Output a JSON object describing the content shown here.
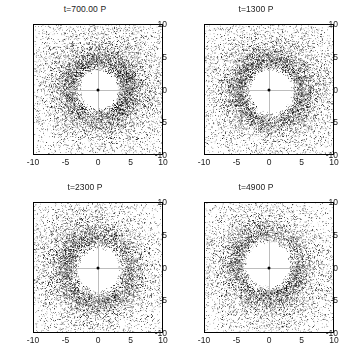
{
  "figure": {
    "layout": "2x2 grid of scatter panels",
    "background_color": "#ffffff",
    "point_color": "#000000"
  },
  "chart_data": [
    {
      "type": "scatter",
      "title": "t=700.00 P",
      "xlabel": "",
      "ylabel": "",
      "xlim": [
        -10,
        10
      ],
      "ylim": [
        -10,
        10
      ],
      "xticks": [
        -10,
        -5,
        0,
        5,
        10
      ],
      "yticks": [
        -10,
        -5,
        0,
        5,
        10
      ],
      "xticklabels": [
        "-10",
        "-5",
        "0",
        "5",
        "10"
      ],
      "yticklabels": [
        "-10",
        "-5",
        "0",
        "5",
        "10"
      ],
      "grid": false,
      "legend": null,
      "n_points": 9000,
      "description": "Particle disk with cleared inner cavity, dense ring, diffuse outer halo",
      "cavity_radius": 3.1,
      "ring_peak_radius": 4.2,
      "ring_outer_radius": 7.0,
      "center": [
        0.15,
        0.0
      ],
      "center_marker": "black dot at origin"
    },
    {
      "type": "scatter",
      "title": "t=1300 P",
      "xlabel": "",
      "ylabel": "",
      "xlim": [
        -10,
        10
      ],
      "ylim": [
        -10,
        10
      ],
      "xticks": [
        -10,
        -5,
        0,
        5,
        10
      ],
      "yticks": [
        -10,
        -5,
        0,
        5,
        10
      ],
      "xticklabels": [
        "-10",
        "-5",
        "0",
        "5",
        "10"
      ],
      "yticklabels": [
        "-10",
        "-5",
        "0",
        "5",
        "10"
      ],
      "grid": false,
      "legend": null,
      "n_points": 8600,
      "description": "Particle disk, cavity slightly larger and offset, dense asymmetric ring",
      "cavity_radius": 3.5,
      "ring_peak_radius": 4.6,
      "ring_outer_radius": 7.3,
      "center": [
        0.3,
        -0.3
      ],
      "center_marker": "black dot at origin"
    },
    {
      "type": "scatter",
      "title": "t=2300 P",
      "xlabel": "",
      "ylabel": "",
      "xlim": [
        -10,
        10
      ],
      "ylim": [
        -10,
        10
      ],
      "xticks": [
        -10,
        -5,
        0,
        5,
        10
      ],
      "yticks": [
        -10,
        -5,
        0,
        5,
        10
      ],
      "xticklabels": [
        "-10",
        "-5",
        "0",
        "5",
        "10"
      ],
      "yticklabels": [
        "-10",
        "-5",
        "0",
        "5",
        "10"
      ],
      "grid": false,
      "legend": null,
      "n_points": 8200,
      "description": "Particle disk, broad dense ring with cavity, halo more diffuse",
      "cavity_radius": 3.4,
      "ring_peak_radius": 4.8,
      "ring_outer_radius": 7.6,
      "center": [
        0.1,
        -0.35
      ],
      "center_marker": "black dot at origin"
    },
    {
      "type": "scatter",
      "title": "t=4900 P",
      "xlabel": "",
      "ylabel": "",
      "xlim": [
        -10,
        10
      ],
      "ylim": [
        -10,
        10
      ],
      "xticks": [
        -10,
        -5,
        0,
        5,
        10
      ],
      "yticks": [
        -10,
        -5,
        0,
        5,
        10
      ],
      "xticklabels": [
        "-10",
        "-5",
        "0",
        "5",
        "10"
      ],
      "yticklabels": [
        "-10",
        "-5",
        "0",
        "5",
        "10"
      ],
      "grid": false,
      "legend": null,
      "n_points": 7600,
      "description": "Particle disk, largest cavity offset upward, thinner ring, sparse halo",
      "cavity_radius": 3.6,
      "ring_peak_radius": 4.7,
      "ring_outer_radius": 7.4,
      "center": [
        -0.2,
        0.5
      ],
      "center_marker": "black dot at origin"
    }
  ]
}
